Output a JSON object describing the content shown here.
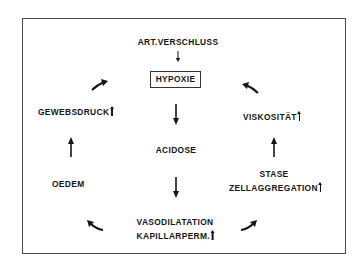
{
  "diagram": {
    "type": "cycle",
    "entry": {
      "label": "ART.VERSCHLUSS",
      "arrow_to": "HYPOXIE"
    },
    "center_node": {
      "label": "HYPOXIE",
      "boxed": true
    },
    "central_chain": [
      {
        "label": "ACIDOSE"
      },
      {
        "label": "VASODILATATION"
      },
      {
        "label": "KAPILLARPERM.",
        "increase_marker": true
      }
    ],
    "left_branch": [
      {
        "label": "OEDEM"
      },
      {
        "label": "GEWEBSDRUCK",
        "increase_marker": true
      }
    ],
    "right_branch": [
      {
        "label": "STASE"
      },
      {
        "label": "ZELLAGGREGATION",
        "increase_marker": true
      },
      {
        "label": "VISKOSITÄT",
        "increase_marker": true
      }
    ],
    "edges": [
      {
        "from": "ART.VERSCHLUSS",
        "to": "HYPOXIE"
      },
      {
        "from": "HYPOXIE",
        "to": "ACIDOSE"
      },
      {
        "from": "ACIDOSE",
        "to": "VASODILATATION / KAPILLARPERM."
      },
      {
        "from": "VASODILATATION / KAPILLARPERM.",
        "to": "OEDEM"
      },
      {
        "from": "OEDEM",
        "to": "GEWEBSDRUCK"
      },
      {
        "from": "GEWEBSDRUCK",
        "to": "HYPOXIE"
      },
      {
        "from": "VASODILATATION / KAPILLARPERM.",
        "to": "STASE / ZELLAGGREGATION"
      },
      {
        "from": "STASE / ZELLAGGREGATION",
        "to": "VISKOSITÄT"
      },
      {
        "from": "VISKOSITÄT",
        "to": "HYPOXIE"
      }
    ]
  },
  "labels": {
    "art_verschluss": "ART.VERSCHLUSS",
    "hypoxie": "HYPOXIE",
    "acidose": "ACIDOSE",
    "vasodilatation": "VASODILATATION",
    "kapillarperm": "KAPILLARPERM.",
    "oedem": "OEDEM",
    "gewebsdruck": "GEWEBSDRUCK",
    "stase": "STASE",
    "zellaggregation": "ZELLAGGREGATION",
    "viskositaet": "VISKOSITÄT"
  },
  "colors": {
    "ink": "#151515",
    "frame": "#4a4a4a",
    "background": "#ffffff"
  }
}
